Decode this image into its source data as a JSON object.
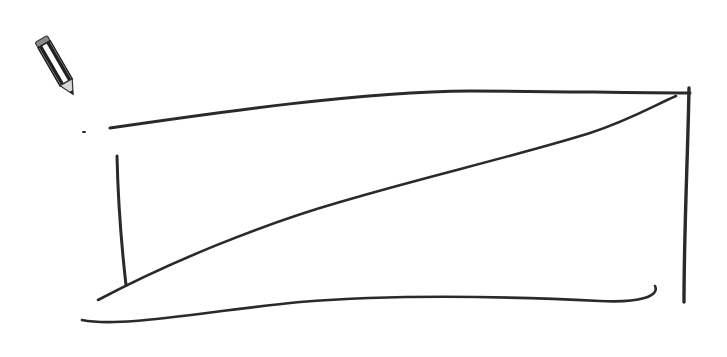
{
  "canvas": {
    "label": "Sketch canvas",
    "background": "#ffffff",
    "stroke_color": "#2a2a2a"
  },
  "tool": {
    "icon": "pencil-icon",
    "label": "Pencil tool"
  },
  "strokes": [
    {
      "name": "top-edge-stroke",
      "path": "M110,128 C220,112 360,92 470,91 C560,91 620,93 690,93"
    },
    {
      "name": "left-edge-stroke",
      "path": "M117,156 C118,200 122,250 126,285"
    },
    {
      "name": "diagonal-stroke",
      "path": "M98,300 C170,262 260,225 340,202 C420,178 520,155 590,133 C630,120 655,105 676,96"
    },
    {
      "name": "bottom-edge-stroke",
      "path": "M82,320 C120,328 200,312 300,302 C400,294 500,296 600,301 C640,303 660,296 655,286"
    },
    {
      "name": "right-edge-stroke",
      "path": "M689,88 C688,150 684,230 684,302"
    },
    {
      "name": "stray-dot",
      "path": "M83,132 L85,132"
    }
  ]
}
